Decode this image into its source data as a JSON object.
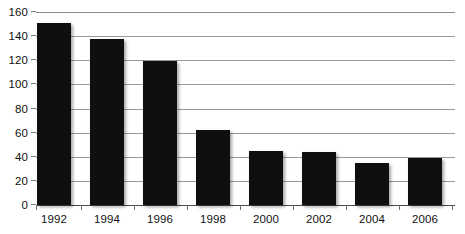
{
  "chart_data": {
    "type": "bar",
    "title": "",
    "subtitle": "",
    "xlabel": "",
    "ylabel": "",
    "categories": [
      "1992",
      "1994",
      "1996",
      "1998",
      "2000",
      "2002",
      "2004",
      "2006"
    ],
    "values": [
      151,
      138,
      119,
      62,
      45,
      44,
      35,
      39
    ],
    "series": [
      {
        "name": "",
        "values": [
          151,
          138,
          119,
          62,
          45,
          44,
          35,
          39
        ]
      }
    ],
    "ylim": [
      0,
      160
    ],
    "ytick_labels": [
      "0",
      "20",
      "40",
      "60",
      "80",
      "100",
      "120",
      "140",
      "160"
    ],
    "ytick_values": [
      0,
      20,
      40,
      60,
      80,
      100,
      120,
      140,
      160
    ],
    "grid": true,
    "grid_axis": "y",
    "legend": false,
    "legend_position": "none",
    "annotations": [],
    "colors": {
      "bar": "#100f0f",
      "gridline": "#9a9a9a",
      "axis": "#4a4a4a",
      "tick_mark": "#7e7e7e",
      "label_text": "#111111",
      "background": "#ffffff"
    }
  }
}
